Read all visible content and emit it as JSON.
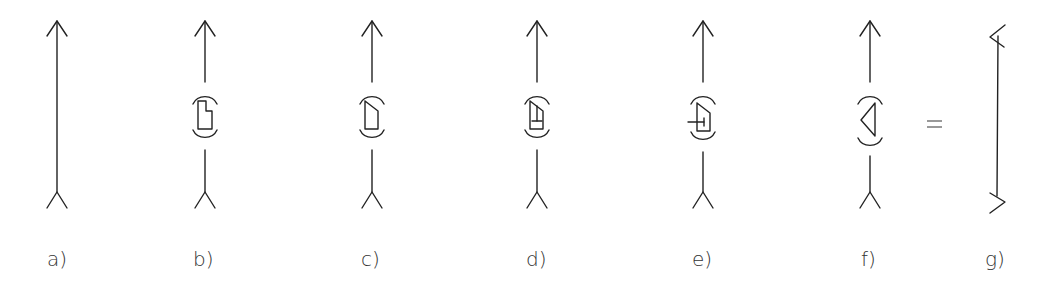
{
  "diagram": {
    "type": "vector-transformation-sequence",
    "panels": [
      {
        "id": "a",
        "label": "a)",
        "x": 57,
        "element": "none",
        "description": "plain line with arrowhead at top and forked tail at bottom"
      },
      {
        "id": "b",
        "label": "b)",
        "x": 205,
        "element": "notched-rectangle",
        "description": "line with bracketed notched rectangle element"
      },
      {
        "id": "c",
        "label": "c)",
        "x": 372,
        "element": "slanted-trapezoid",
        "description": "line with bracketed trapezoid element (slanted top)"
      },
      {
        "id": "d",
        "label": "d)",
        "x": 537,
        "element": "trapezoid-with-inner-tick",
        "description": "trapezoid with inner vertical tick and short horizontal bar"
      },
      {
        "id": "e",
        "label": "e)",
        "x": 703,
        "element": "trapezoid-with-cross",
        "description": "trapezoid with horizontal line crossing out to the left"
      },
      {
        "id": "f",
        "label": "f)",
        "x": 870,
        "element": "triangle",
        "description": "line with bracketed left-pointing triangle element"
      },
      {
        "id": "g",
        "label": "g)",
        "x": 998,
        "element": "none",
        "description": "line with angled chevron ends at top and bottom"
      }
    ],
    "equals_sign": "=",
    "colors": {
      "stroke": "#222222",
      "label": "#333333"
    }
  }
}
